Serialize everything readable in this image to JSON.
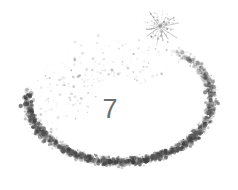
{
  "image": {
    "width": 238,
    "height": 190,
    "background_color": "#ffffff",
    "description": "Speckled stippled crescent arc with a starburst sparkle at one end, enclosing a numeral"
  },
  "center_label": {
    "text": "7",
    "color": "#6f6f6f",
    "font_size_px": 27,
    "center_x": 110,
    "center_y": 105
  },
  "artwork": {
    "ink_color": "#5a5a5a",
    "ink_color_light": "#9e9e9e",
    "ink_color_dark": "#3d3d3d",
    "arc": {
      "shape": "open crescent sweeping from upper-right starburst clockwise down and around to the lower-left tail",
      "center_x": 120,
      "center_y": 100,
      "radius_x": 92,
      "radius_y": 62,
      "start_angle_deg": -58,
      "end_angle_deg": 196,
      "stroke_texture": "stipple",
      "band_thickness": 17,
      "dot_count": 1500,
      "dot_min_radius": 0.35,
      "dot_max_radius": 2.3
    },
    "sparkle": {
      "name": "starburst",
      "center_x": 160,
      "center_y": 27,
      "ray_count": 16,
      "outer_radius": 17,
      "inner_radius": 3,
      "color": "#8a8a8a"
    },
    "haze": {
      "description": "faint sparse dots drifting inside the upper-left of the loop",
      "dot_count": 260,
      "color": "#b9b9b9"
    }
  }
}
